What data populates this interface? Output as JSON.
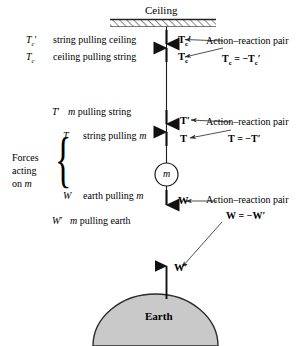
{
  "figure": {
    "title_ceiling": "Ceiling",
    "title_earth": "Earth",
    "mass_label": "m"
  },
  "left_labels": [
    {
      "symbol": "T",
      "symbol_sub": "c",
      "symbol_prime": "′",
      "description": "string pulling ceiling"
    },
    {
      "symbol": "T",
      "symbol_sub": "c",
      "symbol_prime": "",
      "description": "ceiling pulling string"
    },
    {
      "symbol": "T",
      "symbol_sub": "",
      "symbol_prime": "′",
      "description": "m pulling string"
    },
    {
      "symbol": "T",
      "symbol_sub": "",
      "symbol_prime": "",
      "description": "string pulling m"
    },
    {
      "symbol": "W",
      "symbol_sub": "",
      "symbol_prime": "",
      "description": "earth pulling m"
    },
    {
      "symbol": "W",
      "symbol_sub": "",
      "symbol_prime": "′",
      "description": "m pulling earth"
    }
  ],
  "brace_caption": {
    "line1": "Forces",
    "line2": "acting",
    "line3": "on m"
  },
  "vector_labels": [
    {
      "name": "T-c-prime",
      "text": "T",
      "sub": "c",
      "prime": "′"
    },
    {
      "name": "T-c",
      "text": "T",
      "sub": "c",
      "prime": ""
    },
    {
      "name": "T-prime",
      "text": "T",
      "sub": "",
      "prime": "′"
    },
    {
      "name": "T",
      "text": "T",
      "sub": "",
      "prime": ""
    },
    {
      "name": "W",
      "text": "W",
      "sub": "",
      "prime": ""
    },
    {
      "name": "W-prime",
      "text": "W",
      "sub": "",
      "prime": "′"
    }
  ],
  "annotations": [
    {
      "id": "pair-ceiling",
      "caption": "Action–reaction pair",
      "equation_lhs": "T",
      "equation_lhs_sub": "c",
      "equation_rel": "= −",
      "equation_rhs": "T",
      "equation_rhs_sub": "c",
      "equation_rhs_prime": "′"
    },
    {
      "id": "pair-tension",
      "caption": "Action–reaction pair",
      "equation_lhs": "T",
      "equation_lhs_sub": "",
      "equation_rel": "= −",
      "equation_rhs": "T",
      "equation_rhs_sub": "",
      "equation_rhs_prime": "′"
    },
    {
      "id": "pair-weight",
      "caption": "Action–reaction pair",
      "equation_lhs": "W",
      "equation_lhs_sub": "",
      "equation_rel": "= −",
      "equation_rhs": "W",
      "equation_rhs_sub": "",
      "equation_rhs_prime": "′"
    }
  ],
  "colors": {
    "stroke": "#1a1a1a",
    "earth_fill": "#c9c9c9",
    "earth_stroke": "#2b2b2b",
    "background": "#ffffff",
    "leader": "#3a3a3a"
  }
}
